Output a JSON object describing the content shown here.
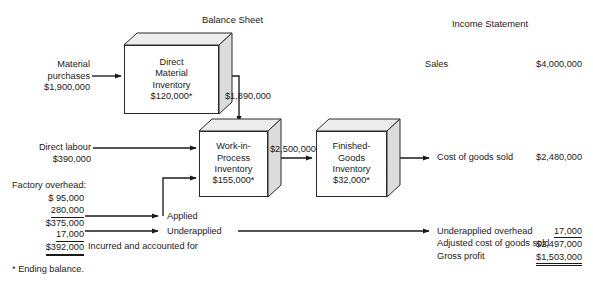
{
  "figure": {
    "title_cutoff": "",
    "headings": {
      "balance_sheet": "Balance Sheet",
      "income_statement": "Income Statement"
    },
    "footnote": "* Ending balance."
  },
  "inputs": {
    "material_purchases": {
      "line1": "Material",
      "line2": "purchases",
      "amount": "$1,900,000"
    },
    "direct_labour": {
      "line1": "Direct labour",
      "amount": "$390,000"
    },
    "factory_overhead": {
      "heading": "Factory overhead:",
      "rows": [
        {
          "value": "$  95,000",
          "rule": "none"
        },
        {
          "value": "280,000",
          "rule": "single"
        },
        {
          "value": "$375,000",
          "rule": "none"
        },
        {
          "value": "17,000",
          "rule": "single"
        },
        {
          "value": "$392,000",
          "rule": "double"
        }
      ],
      "applied_label": "Applied",
      "underapplied_label": "Underapplied",
      "incurred_label": "Incurred and accounted for"
    }
  },
  "boxes": [
    {
      "id": "direct-material-inventory",
      "lines": [
        "Direct",
        "Material",
        "Inventory"
      ],
      "amount": "$120,000*"
    },
    {
      "id": "work-in-process-inventory",
      "lines": [
        "Work-in-",
        "Process",
        "Inventory"
      ],
      "amount": "$155,000*"
    },
    {
      "id": "finished-goods-inventory",
      "lines": [
        "Finished-",
        "Goods",
        "Inventory"
      ],
      "amount": "$32,000*"
    }
  ],
  "flows": {
    "dm_to_wip": "$1,890,000",
    "wip_to_fg": "$2,500,000"
  },
  "income_statement": {
    "sales": {
      "label": "Sales",
      "amount": "$4,000,000"
    },
    "cogs": {
      "label": "Cost of goods sold",
      "amount": "$2,480,000"
    },
    "summary": [
      {
        "label": "Underapplied overhead",
        "amount": "17,000",
        "rule": "single"
      },
      {
        "label": "Adjusted cost of goods sold",
        "amount": "$2,497,000",
        "rule": "none"
      },
      {
        "label": "Gross profit",
        "amount": "$1,503,000",
        "rule": "double"
      }
    ]
  }
}
